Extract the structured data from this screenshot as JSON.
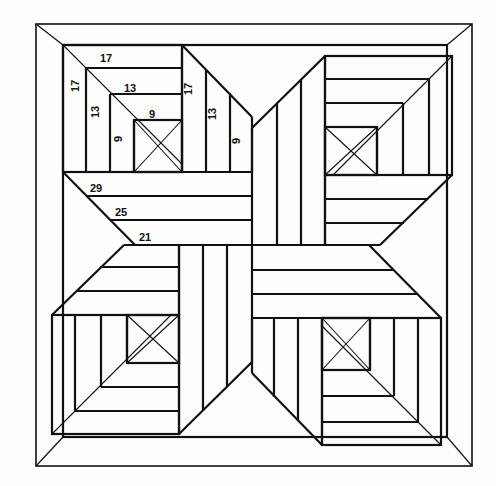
{
  "document": {
    "title": "Pinwheel Log Cabin Quilt Block Diagram",
    "type": "line-drawing-diagram",
    "background_color": "#fdfdfc",
    "ink_color": "#111111"
  },
  "canvas": {
    "width": 496,
    "height": 486
  },
  "frame": {
    "outer_rect": {
      "x": 36,
      "y": 24,
      "w": 436,
      "h": 442
    },
    "inner_rect": {
      "x": 63,
      "y": 45,
      "w": 384,
      "h": 392
    },
    "corner_diagonals": 4
  },
  "geometry": {
    "center": {
      "x": 252,
      "y": 245
    },
    "block_top_left": {
      "x0": 63,
      "y0": 45,
      "x1": 182,
      "y1": 172
    },
    "strip_thickness": 20,
    "symmetry": "4-fold rotational (90 degrees)"
  },
  "labels": {
    "log_cabin_nested": [
      {
        "text": "17",
        "orientation": "horizontal",
        "x": 100,
        "y": 58,
        "ring": 1
      },
      {
        "text": "17",
        "orientation": "vertical",
        "x": 79,
        "y": 88,
        "ring": 1
      },
      {
        "text": "13",
        "orientation": "horizontal",
        "x": 124,
        "y": 88,
        "ring": 2
      },
      {
        "text": "13",
        "orientation": "vertical",
        "x": 99,
        "y": 114,
        "ring": 2
      },
      {
        "text": "9",
        "orientation": "horizontal",
        "x": 149,
        "y": 114,
        "ring": 3
      },
      {
        "text": "9",
        "orientation": "vertical",
        "x": 122,
        "y": 137,
        "ring": 3
      }
    ],
    "vertical_strips": [
      {
        "text": "17",
        "orientation": "vertical",
        "x": 195,
        "y": 90,
        "strip": 1
      },
      {
        "text": "13",
        "orientation": "vertical",
        "x": 219,
        "y": 114,
        "strip": 2
      },
      {
        "text": "9",
        "orientation": "vertical",
        "x": 243,
        "y": 138,
        "strip": 3
      }
    ],
    "horizontal_strips": [
      {
        "text": "29",
        "orientation": "horizontal",
        "x": 94,
        "y": 189,
        "strip": 1
      },
      {
        "text": "25",
        "orientation": "horizontal",
        "x": 119,
        "y": 212,
        "strip": 2
      },
      {
        "text": "21",
        "orientation": "horizontal",
        "x": 143,
        "y": 236,
        "strip": 3
      }
    ]
  },
  "legend_values": {
    "all_numbers": [
      17,
      17,
      13,
      13,
      9,
      9,
      17,
      13,
      9,
      29,
      25,
      21
    ],
    "nested_square_sizes": [
      17,
      13,
      9
    ],
    "strip_sizes": [
      29,
      25,
      21
    ]
  }
}
